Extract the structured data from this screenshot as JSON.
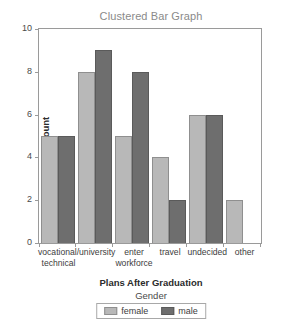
{
  "chart_data": {
    "type": "bar",
    "title": "Clustered Bar Graph",
    "xlabel": "Plans After Graduation",
    "ylabel": "Count",
    "categories": [
      "vocational/technical",
      "university",
      "enter workforce",
      "travel",
      "undecided",
      "other"
    ],
    "category_lines": [
      [
        "vocational/",
        "technical"
      ],
      [
        "university"
      ],
      [
        "enter",
        "workforce"
      ],
      [
        "travel"
      ],
      [
        "undecided"
      ],
      [
        "other"
      ]
    ],
    "series": [
      {
        "name": "female",
        "color": "#b8b8b8",
        "values": [
          5,
          8,
          5,
          4,
          6,
          2
        ]
      },
      {
        "name": "male",
        "color": "#6e6e6e",
        "values": [
          5,
          9,
          8,
          2,
          6,
          0
        ]
      }
    ],
    "ylim": [
      0,
      10
    ],
    "yticks": [
      0,
      2,
      4,
      6,
      8,
      10
    ],
    "ytick_labels": [
      "0",
      "2",
      "4",
      "6",
      "8",
      "10"
    ],
    "grid": false,
    "legend": {
      "title": "Gender",
      "position": "bottom",
      "entries": [
        "female",
        "male"
      ]
    }
  }
}
